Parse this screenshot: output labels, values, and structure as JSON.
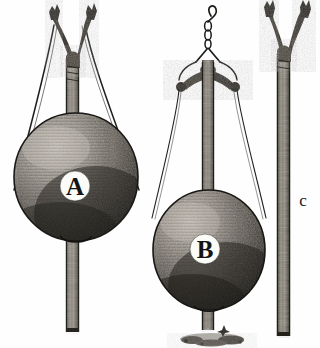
{
  "figure": {
    "background_color": "#fefefe",
    "ink_color": "#2b2b2b",
    "objects": [
      {
        "id": "A",
        "label": "A",
        "name": "forked-pole-with-sphere-and-ropes",
        "description": "Forked pole with suspended spherical head and two splayed ropes",
        "label_x": 75,
        "label_y": 186,
        "label_radius": 15,
        "sphere": {
          "center_x": 76,
          "center_y": 177,
          "radius_x": 62,
          "radius_y": 64,
          "fill": "#6e6a64",
          "shade_dark": "#2e2b28",
          "shade_light": "#b9b4ab"
        },
        "pole": {
          "x": 66,
          "top": 60,
          "bottom": 332,
          "width": 13,
          "fill": "#6b665e"
        },
        "fork": {
          "left_tip_x": 52,
          "right_tip_x": 84,
          "tip_y": 14,
          "junction_y": 62
        },
        "ropes": [
          {
            "from_x": 54,
            "from_y": 24,
            "to_x": 13,
            "to_y": 188
          },
          {
            "from_x": 84,
            "from_y": 24,
            "to_x": 139,
            "to_y": 188
          }
        ]
      },
      {
        "id": "B",
        "label": "B",
        "name": "hooked-pole-with-sphere-and-crosspiece",
        "description": "Pole hung from hook and chain, with knobbed crosspiece, sphere, and ground base",
        "label_x": 205,
        "label_y": 249,
        "label_radius": 15,
        "sphere": {
          "center_x": 209,
          "center_y": 250,
          "radius_x": 56,
          "radius_y": 60,
          "fill": "#6a665f",
          "shade_dark": "#2b2825",
          "shade_light": "#b5b0a7"
        },
        "pole": {
          "x": 202,
          "top": 62,
          "bottom": 330,
          "width": 12,
          "fill": "#6b665e"
        },
        "hook": {
          "x": 207,
          "top": 5,
          "bottom": 46,
          "links": 3
        },
        "crosspiece": {
          "left_x": 178,
          "right_x": 237,
          "y": 78,
          "knob_radius": 5
        },
        "ropes": [
          {
            "from_x": 183,
            "from_y": 82,
            "to_x": 152,
            "to_y": 215
          },
          {
            "from_x": 233,
            "from_y": 82,
            "to_x": 266,
            "to_y": 215
          }
        ],
        "ground": {
          "center_x": 212,
          "y": 337,
          "width": 62,
          "height": 11
        }
      },
      {
        "id": "C",
        "label": "c",
        "name": "plain-forked-pole",
        "description": "Plain forked walking pole without sphere",
        "label_x": 303,
        "label_y": 200,
        "pole": {
          "x": 277,
          "top": 54,
          "bottom": 336,
          "width": 13,
          "fill": "#6b665e"
        },
        "fork": {
          "left_tip_x": 266,
          "right_tip_x": 300,
          "tip_y": 10,
          "junction_y": 56
        }
      }
    ]
  }
}
